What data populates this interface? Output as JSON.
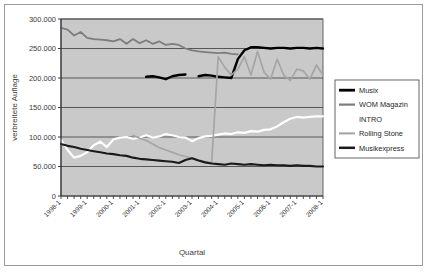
{
  "chart_data": {
    "type": "line",
    "title": "",
    "xlabel": "Quartal",
    "ylabel": "verbreitete Auflage",
    "ylim": [
      0,
      300000
    ],
    "ytick_values": [
      0,
      50000,
      100000,
      150000,
      200000,
      250000,
      300000
    ],
    "ytick_labels": [
      "0",
      "50.000",
      "100.000",
      "150.000",
      "200.000",
      "250.000",
      "300.000"
    ],
    "grid": true,
    "legend_position": "right",
    "plot_background": "#c9c9c9",
    "x": [
      "1998-1",
      "1998-2",
      "1998-3",
      "1998-4",
      "1999-1",
      "1999-2",
      "1999-3",
      "1999-4",
      "2000-1",
      "2000-2",
      "2000-3",
      "2000-4",
      "2001-1",
      "2001-2",
      "2001-3",
      "2001-4",
      "2002-1",
      "2002-2",
      "2002-3",
      "2002-4",
      "2003-1",
      "2003-2",
      "2003-3",
      "2003-4",
      "2004-1",
      "2004-2",
      "2004-3",
      "2004-4",
      "2005-1",
      "2005-2",
      "2005-3",
      "2005-4",
      "2006-1",
      "2006-2",
      "2006-3",
      "2006-4",
      "2007-1",
      "2007-2",
      "2007-3",
      "2007-4",
      "2008-1"
    ],
    "xtick_labels": [
      "1998-1",
      "1999-1",
      "2000-1",
      "2001-1",
      "2002-1",
      "2003-1",
      "2004-1",
      "2005-1",
      "2006-1",
      "2007-1",
      "2008-1"
    ],
    "xtick_indices": [
      0,
      4,
      8,
      12,
      16,
      20,
      24,
      28,
      32,
      36,
      40
    ],
    "series": [
      {
        "name": "Musix",
        "color": "#000000",
        "width": 2.4,
        "values": [
          null,
          null,
          null,
          null,
          null,
          null,
          null,
          null,
          null,
          null,
          null,
          null,
          null,
          202000,
          203000,
          201000,
          198000,
          203000,
          205000,
          206000,
          null,
          203000,
          205000,
          204000,
          202000,
          201000,
          200000,
          232000,
          247000,
          252000,
          252000,
          251000,
          250000,
          251000,
          251000,
          250000,
          251000,
          251000,
          250000,
          251000,
          250000
        ]
      },
      {
        "name": "WOM Magazin",
        "color": "#7d7d7d",
        "width": 1.8,
        "values": [
          285000,
          282000,
          272000,
          278000,
          268000,
          266000,
          265000,
          264000,
          262000,
          266000,
          258000,
          266000,
          259000,
          264000,
          258000,
          262000,
          256000,
          258000,
          256000,
          250000,
          247000,
          245000,
          244000,
          243000,
          242000,
          243000,
          241000,
          240000,
          null,
          null,
          null,
          null,
          null,
          null,
          null,
          null,
          null,
          null,
          null,
          null,
          null
        ]
      },
      {
        "name": "INTRO",
        "color": "#ffffff",
        "width": 2.2,
        "values": [
          95000,
          78000,
          65000,
          68000,
          74000,
          86000,
          92000,
          83000,
          96000,
          99000,
          100000,
          97000,
          99000,
          103000,
          99000,
          101000,
          105000,
          103000,
          100000,
          99000,
          93000,
          98000,
          101000,
          102000,
          104000,
          106000,
          105000,
          108000,
          107000,
          110000,
          109000,
          112000,
          113000,
          118000,
          125000,
          131000,
          134000,
          133000,
          134000,
          135000,
          135000
        ]
      },
      {
        "name": "Rolling Stone",
        "color": "#a5a5a5",
        "width": 1.7,
        "values": [
          null,
          null,
          null,
          null,
          null,
          null,
          null,
          null,
          null,
          null,
          null,
          103000,
          98000,
          94000,
          88000,
          82000,
          78000,
          74000,
          70000,
          67000,
          64000,
          61000,
          58000,
          56000,
          236000,
          218000,
          205000,
          215000,
          236000,
          205000,
          245000,
          210000,
          198000,
          232000,
          205000,
          196000,
          215000,
          212000,
          198000,
          222000,
          205000
        ]
      },
      {
        "name": "Musikexpress",
        "color": "#1a1a1a",
        "width": 2.1,
        "values": [
          88000,
          85000,
          83000,
          80000,
          78000,
          76000,
          74000,
          72000,
          71000,
          69000,
          68000,
          65000,
          63000,
          62000,
          61000,
          60000,
          59000,
          58000,
          56000,
          61000,
          64000,
          60000,
          57000,
          55000,
          54000,
          53000,
          55000,
          54000,
          53000,
          54000,
          53000,
          52000,
          53000,
          52000,
          52000,
          51000,
          52000,
          51000,
          51000,
          50000,
          50000
        ]
      }
    ]
  },
  "legend": {
    "items": [
      {
        "label": "Musix"
      },
      {
        "label": "WOM Magazin"
      },
      {
        "label": "INTRO"
      },
      {
        "label": "Rolling Stone"
      },
      {
        "label": "Musikexpress"
      }
    ]
  }
}
